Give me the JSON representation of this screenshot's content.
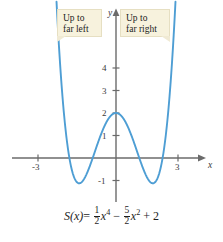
{
  "figure": {
    "equation": {
      "function_name": "S",
      "variable": "x",
      "full_text": "S(x) = 1/2 x^4 - 5/2 x^2 + 2",
      "lhs": "S(x)",
      "equals": "=",
      "term1_numerator": "1",
      "term1_denominator": "2",
      "term1_power": "4",
      "operator1": "−",
      "term2_numerator": "5",
      "term2_denominator": "2",
      "term2_power": "2",
      "operator2": "+",
      "constant": "2"
    },
    "callouts": [
      {
        "name": "left",
        "text": "Up to\nfar left"
      },
      {
        "name": "right",
        "text": "Up to\nfar right"
      }
    ],
    "axis_names": {
      "x": "x",
      "y": "y"
    }
  },
  "chart_data": {
    "type": "line",
    "title": "",
    "subtitle": "",
    "xlabel": "x",
    "ylabel": "y",
    "grid": false,
    "legend": null,
    "xlim": [
      -3.6,
      3.6
    ],
    "ylim": [
      -1.9,
      5.6
    ],
    "xticks": [
      -3,
      3
    ],
    "xtick_labels": [
      "-3",
      "3"
    ],
    "yticks": [
      1,
      2,
      3,
      4
    ],
    "ytick_labels": [
      "1",
      "2",
      "3",
      "4"
    ],
    "ytick_labels_negative": [
      "-1"
    ],
    "yticks_negative": [
      -1
    ],
    "curve_color": "#4e9ed4",
    "axis_color": "#6b6b6b",
    "function": "S(x) = 0.5*x^4 - 2.5*x^2 + 2",
    "series": [
      {
        "name": "S(x)",
        "x": [
          -2.45,
          -2.4,
          -2.3,
          -2.2,
          -2.1,
          -2.0,
          -1.9,
          -1.8,
          -1.7,
          -1.6,
          -1.5,
          -1.4,
          -1.3,
          -1.2,
          -1.1,
          -1.0,
          -0.9,
          -0.8,
          -0.7,
          -0.6,
          -0.5,
          -0.4,
          -0.3,
          -0.2,
          -0.1,
          0.0,
          0.1,
          0.2,
          0.3,
          0.4,
          0.5,
          0.6,
          0.7,
          0.8,
          0.9,
          1.0,
          1.1,
          1.2,
          1.3,
          1.4,
          1.5,
          1.6,
          1.7,
          1.8,
          1.9,
          2.0,
          2.1,
          2.2,
          2.3,
          2.4,
          2.45
        ],
        "y": [
          3.02,
          2.18,
          0.75,
          -0.38,
          -1.12,
          -2.0,
          -1.02,
          -1.15,
          -1.05,
          -0.72,
          -0.11,
          -0.98,
          -0.8,
          -0.564,
          -0.292,
          -0.0,
          0.303,
          0.605,
          0.895,
          1.165,
          1.406,
          1.613,
          1.78,
          1.902,
          1.975,
          2.0,
          1.975,
          1.902,
          1.78,
          1.613,
          1.406,
          1.165,
          0.895,
          0.605,
          0.303,
          0.0,
          -0.292,
          -0.564,
          -0.8,
          -0.98,
          -1.094,
          -1.125,
          -1.047,
          -0.832,
          -0.448,
          0.0,
          0.858,
          1.92,
          3.24,
          4.86,
          5.8
        ],
        "color": "#4e9ed4"
      }
    ],
    "annotations": [
      {
        "text": "Up to far left",
        "position": "top-left",
        "points_to": "left branch"
      },
      {
        "text": "Up to far right",
        "position": "top-right",
        "points_to": "right branch"
      }
    ],
    "key_points": {
      "local_maximum": {
        "x": 0,
        "y": 2
      },
      "local_minima": [
        {
          "x": -1.581,
          "y": -1.125
        },
        {
          "x": 1.581,
          "y": -1.125
        }
      ],
      "x_intercepts": [
        -2.0,
        -1.0,
        1.0,
        2.0
      ],
      "y_intercept": 2
    }
  }
}
